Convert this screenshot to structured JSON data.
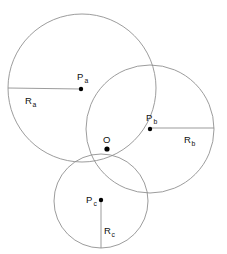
{
  "figure": {
    "background_color": "#ffffff",
    "stroke_color": "#8a8a8a",
    "label_color": "#111111",
    "width": 227,
    "height": 254
  },
  "circles": [
    {
      "id": "a",
      "center_label": "P",
      "center_subscript": "a",
      "radius_label": "R",
      "radius_subscript": "a",
      "cx": 82,
      "cy": 88,
      "r": 74,
      "center_label_x": 77,
      "center_label_y": 80,
      "center_sub_x": 84.5,
      "center_sub_y": 83,
      "dot_x": 81,
      "dot_y": 89,
      "radius_line_x1": 81,
      "radius_line_y1": 89,
      "radius_line_x2": 8,
      "radius_line_y2": 88,
      "radius_label_x": 25,
      "radius_label_y": 104,
      "radius_sub_x": 32.5,
      "radius_sub_y": 107
    },
    {
      "id": "b",
      "center_label": "P",
      "center_subscript": "b",
      "radius_label": "R",
      "radius_subscript": "b",
      "cx": 150,
      "cy": 129,
      "r": 64,
      "center_label_x": 146,
      "center_label_y": 121,
      "center_sub_x": 153.5,
      "center_sub_y": 124,
      "dot_x": 150,
      "dot_y": 129,
      "radius_line_x1": 150,
      "radius_line_y1": 128,
      "radius_line_x2": 214,
      "radius_line_y2": 128,
      "radius_label_x": 184,
      "radius_label_y": 143,
      "radius_sub_x": 191.5,
      "radius_sub_y": 146
    },
    {
      "id": "c",
      "center_label": "P",
      "center_subscript": "c",
      "radius_label": "R",
      "radius_subscript": "c",
      "cx": 101,
      "cy": 201,
      "r": 47,
      "center_label_x": 86,
      "center_label_y": 203,
      "center_sub_x": 93.5,
      "center_sub_y": 206,
      "dot_x": 101,
      "dot_y": 200,
      "radius_line_x1": 101,
      "radius_line_y1": 200,
      "radius_line_x2": 101,
      "radius_line_y2": 248,
      "radius_label_x": 104,
      "radius_label_y": 234,
      "radius_sub_x": 111.5,
      "radius_sub_y": 237
    }
  ],
  "intersection_point": {
    "label": "O",
    "x": 107,
    "y": 149,
    "label_x": 103,
    "label_y": 143,
    "dot_radius": 2.6
  }
}
